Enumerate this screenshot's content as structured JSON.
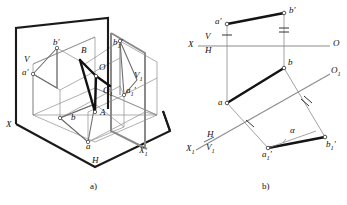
{
  "figure": {
    "title_a": "a)",
    "title_b": "b)",
    "colors": {
      "heavy_line": "#1a1a1a",
      "light_line": "#8c8c8c",
      "mid_line": "#4d4d4d",
      "label": "#111111",
      "background": "#ffffff"
    }
  },
  "panel_a": {
    "caption": "a)",
    "labels": [
      {
        "id": "plane-V",
        "text": "V",
        "sub": "",
        "x": 24,
        "y": 55
      },
      {
        "id": "plane-V1",
        "text": "V",
        "sub": "1",
        "x": 134,
        "y": 71
      },
      {
        "id": "plane-H",
        "text": "H",
        "sub": "",
        "x": 92,
        "y": 156
      },
      {
        "id": "axis-X",
        "text": "X",
        "sub": "",
        "x": 6,
        "y": 120
      },
      {
        "id": "axis-X1",
        "text": "X",
        "sub": "1",
        "x": 139,
        "y": 146
      },
      {
        "id": "point-b-prime",
        "text": "b",
        "sub": "",
        "prime": "'",
        "x": 53,
        "y": 45
      },
      {
        "id": "point-a-prime",
        "text": "a",
        "sub": "",
        "prime": "'",
        "x": 27,
        "y": 75
      },
      {
        "id": "point-B",
        "text": "B",
        "sub": "",
        "prime": "",
        "x": 81,
        "y": 53
      },
      {
        "id": "point-O",
        "text": "O",
        "sub": "",
        "prime": "",
        "x": 99,
        "y": 70
      },
      {
        "id": "point-O1",
        "text": "O",
        "sub": "1",
        "prime": "",
        "x": 103,
        "y": 93
      },
      {
        "id": "point-A",
        "text": "A",
        "sub": "",
        "prime": "",
        "x": 99,
        "y": 113
      },
      {
        "id": "point-b",
        "text": "b",
        "sub": "",
        "prime": "",
        "x": 75,
        "y": 117
      },
      {
        "id": "point-a",
        "text": "a",
        "sub": "",
        "prime": "",
        "x": 90,
        "y": 146
      },
      {
        "id": "point-b1-prime",
        "text": "b",
        "sub": "1",
        "prime": "'",
        "x": 113,
        "y": 45
      },
      {
        "id": "point-a1-prime",
        "text": "a",
        "sub": "1",
        "prime": "'",
        "x": 128,
        "y": 92
      }
    ]
  },
  "panel_b": {
    "caption": "b)",
    "labels": [
      {
        "id": "axis-X-left",
        "text": "X",
        "sub": "",
        "prime": "",
        "x": 190,
        "y": 43
      },
      {
        "id": "axis-V-top",
        "text": "V",
        "sub": "",
        "prime": "",
        "x": 206,
        "y": 37
      },
      {
        "id": "axis-H-bottom",
        "text": "H",
        "sub": "",
        "prime": "",
        "x": 206,
        "y": 50
      },
      {
        "id": "axis-O-right",
        "text": "O",
        "sub": "",
        "prime": "",
        "x": 333,
        "y": 43
      },
      {
        "id": "axis-X1",
        "text": "X",
        "sub": "1",
        "prime": "",
        "x": 188,
        "y": 148
      },
      {
        "id": "axis-H-second",
        "text": "H",
        "sub": "",
        "prime": "",
        "x": 208,
        "y": 135
      },
      {
        "id": "axis-V1",
        "text": "V",
        "sub": "1",
        "prime": "",
        "x": 207,
        "y": 148
      },
      {
        "id": "axis-O1",
        "text": "O",
        "sub": "1",
        "prime": "",
        "x": 332,
        "y": 72
      },
      {
        "id": "point-a-prime",
        "text": "a",
        "sub": "",
        "prime": "'",
        "x": 218,
        "y": 28
      },
      {
        "id": "point-b-prime",
        "text": "b",
        "sub": "",
        "prime": "'",
        "x": 285,
        "y": 6
      },
      {
        "id": "point-a",
        "text": "a",
        "sub": "",
        "prime": "",
        "x": 226,
        "y": 99
      },
      {
        "id": "point-b",
        "text": "b",
        "sub": "",
        "prime": "",
        "x": 307,
        "y": 61
      },
      {
        "id": "point-a1-prime",
        "text": "a",
        "sub": "1",
        "prime": "'",
        "x": 264,
        "y": 152
      },
      {
        "id": "point-b1-prime",
        "text": "b",
        "sub": "1",
        "prime": "'",
        "x": 323,
        "y": 143
      },
      {
        "id": "angle-alpha",
        "text": "α",
        "sub": "",
        "prime": "",
        "x": 304,
        "y": 127
      }
    ]
  }
}
